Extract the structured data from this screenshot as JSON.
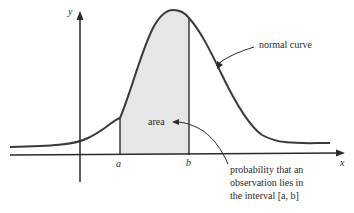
{
  "diagram": {
    "type": "normal distribution area illustration",
    "axes": {
      "x_label": "x",
      "y_label": "y"
    },
    "interval": {
      "lower_label": "a",
      "upper_label": "b"
    },
    "labels": {
      "curve": "normal curve",
      "area": "area",
      "probability_line1": "probability that an",
      "probability_line2": "observation lies in",
      "probability_line3": "the interval [a, b]"
    },
    "colors": {
      "line": "#3a3a3a",
      "shaded_area": "#e6e6e6",
      "background": "#ffffff"
    }
  }
}
